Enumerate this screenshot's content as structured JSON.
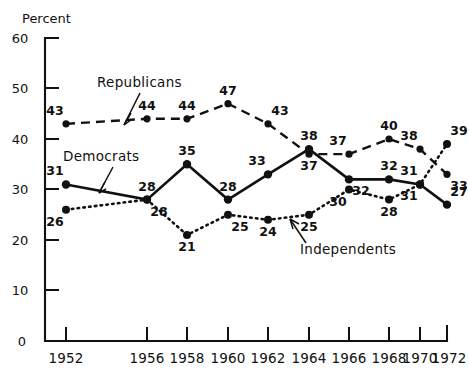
{
  "chart_data": {
    "type": "line",
    "title": "",
    "xlabel": "",
    "ylabel": "Percent",
    "ylim": [
      0,
      60
    ],
    "yticks": [
      0,
      10,
      20,
      30,
      40,
      50,
      60
    ],
    "grid": false,
    "legend_position": "inline-annotations",
    "categories": [
      "1952",
      "1956",
      "1958",
      "1960",
      "1962",
      "1964",
      "1966",
      "1968",
      "1970",
      "1972"
    ],
    "x": [
      1952,
      1956,
      1958,
      1960,
      1962,
      1964,
      1966,
      1968,
      1970,
      1972
    ],
    "series": [
      {
        "name": "Republicans",
        "style": "dashed",
        "values": [
          43,
          44,
          44,
          47,
          43,
          37,
          37,
          40,
          38,
          33
        ],
        "label_positions": [
          "above-left",
          "above",
          "above",
          "above",
          "above-right",
          "below",
          "above-left",
          "above",
          "above-left",
          "below-right"
        ]
      },
      {
        "name": "Democrats",
        "style": "solid",
        "values": [
          31,
          28,
          35,
          28,
          33,
          38,
          32,
          32,
          31,
          27
        ],
        "label_positions": [
          "above-left",
          "above",
          "above",
          "above",
          "above-left",
          "above",
          "below-right",
          "above",
          "above-left",
          "above-right"
        ]
      },
      {
        "name": "Independents",
        "style": "dotted",
        "values": [
          26,
          28,
          21,
          25,
          24,
          25,
          30,
          28,
          31,
          39
        ],
        "label_positions": [
          "below-left",
          "below-right",
          "below",
          "below-right",
          "below",
          "below",
          "below-left",
          "below",
          "below-left",
          "above-right"
        ]
      }
    ],
    "annotations": [
      {
        "text": "Republicans",
        "series": "Republicans",
        "has_arrow": true
      },
      {
        "text": "Democrats",
        "series": "Democrats",
        "has_arrow": true
      },
      {
        "text": "Independents",
        "series": "Independents",
        "has_arrow": true
      }
    ]
  },
  "axis": {
    "y_title": "Percent",
    "y_ticks": [
      "60",
      "50",
      "40",
      "30",
      "20",
      "10",
      "0"
    ],
    "x_ticks": [
      "1952",
      "1956",
      "1958",
      "1960",
      "1962",
      "1964",
      "1966",
      "1968",
      "1970",
      "1972"
    ]
  },
  "labels": {
    "republicans": "Republicans",
    "democrats": "Democrats",
    "independents": "Independents"
  },
  "rep_values": [
    "43",
    "44",
    "44",
    "47",
    "43",
    "37",
    "37",
    "40",
    "38",
    "33"
  ],
  "dem_values": [
    "31",
    "28",
    "35",
    "28",
    "33",
    "38",
    "32",
    "32",
    "31",
    "27"
  ],
  "ind_values": [
    "26",
    "28",
    "21",
    "25",
    "24",
    "25",
    "30",
    "28",
    "31",
    "39"
  ],
  "colors": {
    "ink": "#111111",
    "background": "#ffffff"
  }
}
